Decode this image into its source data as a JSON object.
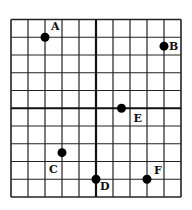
{
  "diagram": {
    "type": "coordinate-grid",
    "grid": {
      "columns": 10,
      "rows": 10,
      "left": 11,
      "top": 19.5,
      "cell_width": 17.0,
      "cell_height": 17.75,
      "axis_column_line": 5,
      "axis_row_line": 5,
      "line_color": "#222222",
      "axis_color": "#111111"
    },
    "points": [
      {
        "label": "A",
        "x": -3,
        "y": 4,
        "label_dx": 6,
        "label_dy": -7
      },
      {
        "label": "B",
        "x": 4,
        "y": 3.5,
        "label_dx": 5,
        "label_dy": 4
      },
      {
        "label": "C",
        "x": -2,
        "y": -2.5,
        "label_dx": -13,
        "label_dy": 20
      },
      {
        "label": "D",
        "x": 0,
        "y": -4,
        "label_dx": 4,
        "label_dy": 11
      },
      {
        "label": "E",
        "x": 1.5,
        "y": 0,
        "label_dx": 12,
        "label_dy": 14
      },
      {
        "label": "F",
        "x": 3,
        "y": -4,
        "label_dx": 7,
        "label_dy": -5
      }
    ],
    "point_color": "#000000",
    "point_radius": 4.5
  }
}
